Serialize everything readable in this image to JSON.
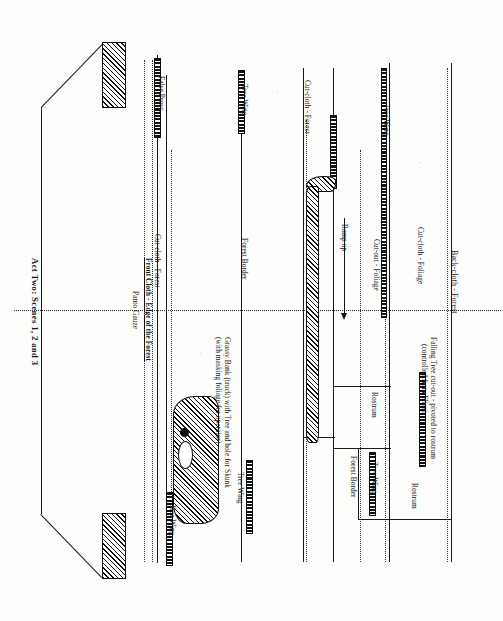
{
  "document": {
    "kind": "theatre-stage-plan",
    "title": "Act Two: Scenes 1, 2 and 3",
    "orientation": "landscape-plan-rotated-90"
  },
  "labels": {
    "false_prosc": "False Prosc.",
    "cutcloth_forest_left": "Cut-cloth - Forest",
    "front_cloth": "Front Cloth - Edge of the Forest",
    "panto_gauze": "Panto Gauze",
    "tree_wing_1": "Tree Wing",
    "forest_border_left": "Forest Border",
    "tree_wing_2": "Tree Wing",
    "tree_wing_3": "Tree Wing",
    "grassy_bank_line1": "Grassy Bank (truck) with Tree and hole for Skunk",
    "grassy_bank_line2": "(with masking foliage for operator)",
    "cutcloth_forest_mid": "Cut-cloth - Forest",
    "ramp_up": "Ramp up",
    "tree_wing_4": "Tree Wing",
    "cutout_foliage": "Cut-out - Foliage",
    "cutcloth_foliage": "Cut-cloth - Foliage",
    "rostrum_1": "Rostrum",
    "rostrum_2": "Rostrum",
    "tree_wing_5": "Tree Wing",
    "forest_border_right": "Forest Border",
    "backcloth_forest": "Back-cloth - Forest",
    "falling_tree_line1": "Falling Tree cut-out - pivoted to rostrum",
    "falling_tree_line2": "(controlled from Flies)"
  },
  "colors": {
    "ink": "#141414",
    "paper": "#fdfdfc",
    "hatch": "#111111"
  }
}
